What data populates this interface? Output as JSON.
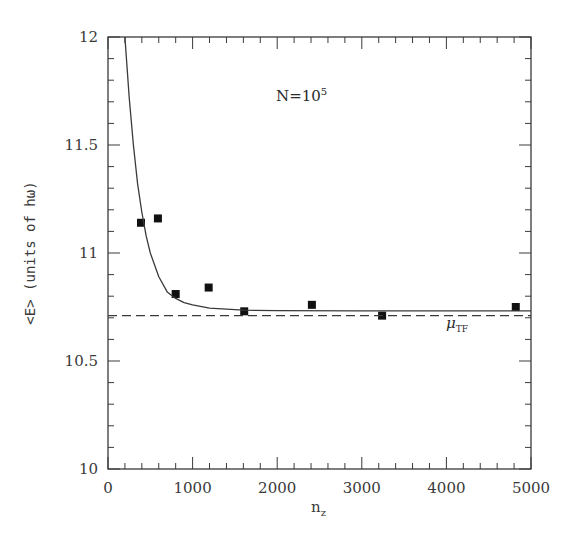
{
  "chart_data": {
    "type": "scatter",
    "title": "",
    "xlabel": "n_z",
    "ylabel": "<E> (units of hω)",
    "xlim": [
      0,
      5000
    ],
    "ylim": [
      10,
      12
    ],
    "grid": false,
    "legend": null,
    "x_ticks": [
      0,
      1000,
      2000,
      3000,
      4000,
      5000
    ],
    "x_tick_labels": [
      "0",
      "1000",
      "2000",
      "3000",
      "4000",
      "5000"
    ],
    "y_ticks": [
      10,
      10.5,
      11,
      11.5,
      12
    ],
    "y_tick_labels": [
      "10",
      "10.5",
      "11",
      "11.5",
      "12"
    ],
    "annotations": [
      {
        "text": "N=10^5",
        "x": 2000,
        "y": 11.76
      },
      {
        "text": "μ_TF",
        "x": 4000,
        "y": 10.66
      }
    ],
    "series": [
      {
        "name": "data points",
        "kind": "scatter",
        "marker": "square",
        "x": [
          390,
          590,
          800,
          1190,
          1610,
          2410,
          3240,
          4820
        ],
        "y": [
          11.14,
          11.16,
          10.81,
          10.84,
          10.73,
          10.76,
          10.71,
          10.75
        ]
      },
      {
        "name": "fit curve",
        "kind": "line",
        "style": "solid",
        "x": [
          200,
          250,
          300,
          350,
          400,
          450,
          500,
          600,
          700,
          800,
          900,
          1000,
          1200,
          1400,
          1600,
          2000,
          3000,
          4000,
          5000
        ],
        "y": [
          12.0,
          11.72,
          11.5,
          11.32,
          11.19,
          11.08,
          11.0,
          10.89,
          10.82,
          10.79,
          10.77,
          10.76,
          10.745,
          10.74,
          10.735,
          10.733,
          10.732,
          10.732,
          10.732
        ]
      },
      {
        "name": "μ_TF",
        "kind": "hline",
        "style": "dashed",
        "y": 10.71
      }
    ]
  },
  "labels": {
    "ylabel": "<E> (units of hω)",
    "xlabel_main": "n",
    "xlabel_sub": "z",
    "annot_base": "N=10",
    "annot_exp": "5",
    "mu_main": "μ",
    "mu_sub": "TF"
  }
}
